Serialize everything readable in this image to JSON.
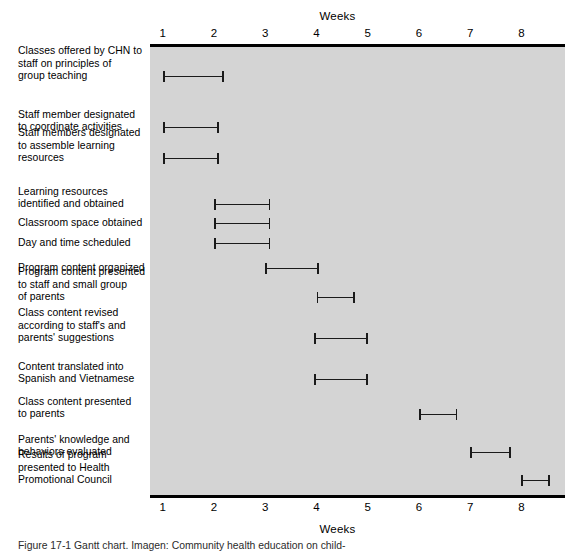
{
  "figure": {
    "caption": "Figure 17-1  Gantt chart. Imagen: Community health education on child-"
  },
  "axis": {
    "title_top": "Weeks",
    "title_bottom": "Weeks",
    "unit": "Weeks",
    "ticks": [
      "1",
      "2",
      "3",
      "4",
      "5",
      "6",
      "7",
      "8"
    ],
    "tick_values": [
      1,
      2,
      3,
      4,
      5,
      6,
      7,
      8
    ],
    "range": [
      0.75,
      8.85
    ],
    "plot_background": "#d4d4d4",
    "bar_color": "#1a1a1a",
    "rule_color": "#000000"
  },
  "chart_data": {
    "type": "bar",
    "orientation": "horizontal",
    "subtype": "gantt",
    "title": "",
    "xlabel": "Weeks",
    "ylabel": "",
    "xlim": [
      0.75,
      8.85
    ],
    "grid": false,
    "legend": null,
    "categories": [
      "Classes offered by CHN to staff on principles of group teaching",
      "Staff member designated to coordinate activities",
      "Staff members designated to assemble learning resources",
      "Learning resources identified and obtained",
      "Classroom space obtained",
      "Day and time scheduled",
      "Program content organized",
      "Program content presented to staff and small group of parents",
      "Class content revised according to staff's and parents' suggestions",
      "Content translated into Spanish and Vietnamese",
      "Class content presented to parents",
      "Parents' knowledge and behaviors evaluated",
      "Results of program presented to Health Promotional Council"
    ],
    "tasks": [
      {
        "label_lines": [
          "Classes offered by CHN to",
          "staff on principles of",
          "group teaching"
        ],
        "start": 1.0,
        "end": 2.2
      },
      {
        "label_lines": [
          "Staff member designated",
          "to coordinate activities"
        ],
        "start": 1.0,
        "end": 2.1
      },
      {
        "label_lines": [
          "Staff members designated",
          "to assemble learning",
          "resources"
        ],
        "start": 1.0,
        "end": 2.1
      },
      {
        "label_lines": [
          "Learning resources",
          "identified and obtained"
        ],
        "start": 2.0,
        "end": 3.1
      },
      {
        "label_lines": [
          "Classroom space obtained"
        ],
        "start": 2.0,
        "end": 3.1
      },
      {
        "label_lines": [
          "Day and time scheduled"
        ],
        "start": 2.0,
        "end": 3.1
      },
      {
        "label_lines": [
          "Program content organized"
        ],
        "start": 3.0,
        "end": 4.05
      },
      {
        "label_lines": [
          "Program content presented",
          "to staff and small group",
          "of parents"
        ],
        "start": 4.0,
        "end": 4.75
      },
      {
        "label_lines": [
          "Class content revised",
          "according to staff's and",
          "parents' suggestions"
        ],
        "start": 3.95,
        "end": 5.0
      },
      {
        "label_lines": [
          "Content translated into",
          "Spanish and Vietnamese"
        ],
        "start": 3.95,
        "end": 5.0
      },
      {
        "label_lines": [
          "Class content presented",
          "to parents"
        ],
        "start": 6.0,
        "end": 6.75
      },
      {
        "label_lines": [
          "Parents' knowledge and",
          "behaviors evaluated"
        ],
        "start": 7.0,
        "end": 7.8
      },
      {
        "label_lines": [
          "Results of program",
          "presented to Health",
          "Promotional Council"
        ],
        "start": 8.0,
        "end": 8.55
      }
    ]
  }
}
